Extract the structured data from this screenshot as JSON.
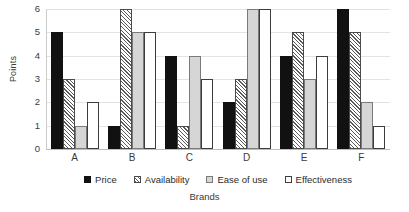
{
  "chart_data": {
    "type": "bar",
    "title": "",
    "xlabel": "Brands",
    "ylabel": "Points",
    "categories": [
      "A",
      "B",
      "C",
      "D",
      "E",
      "F"
    ],
    "series": [
      {
        "name": "Price",
        "values": [
          5,
          1,
          4,
          2,
          4,
          6
        ],
        "fill": "solid-black",
        "color": "#111111"
      },
      {
        "name": "Availability",
        "values": [
          3,
          6,
          1,
          3,
          5,
          5
        ],
        "fill": "diagonal-hatch",
        "color": "#5a5a5a"
      },
      {
        "name": "Ease of use",
        "values": [
          1,
          5,
          4,
          6,
          3,
          2
        ],
        "fill": "light-gray",
        "color": "#d6d6d6"
      },
      {
        "name": "Effectiveness",
        "values": [
          2,
          5,
          3,
          6,
          4,
          1
        ],
        "fill": "white-outline",
        "color": "#ffffff"
      }
    ],
    "ylim": [
      0,
      6
    ],
    "yticks": [
      0,
      1,
      2,
      3,
      4,
      5,
      6
    ],
    "grid": true,
    "legend_position": "bottom"
  }
}
